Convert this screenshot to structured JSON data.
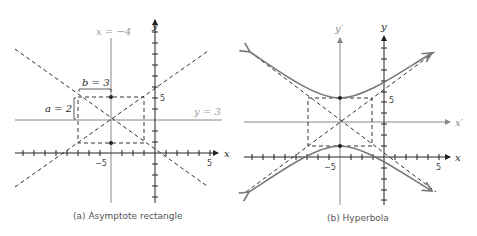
{
  "panels": [
    {
      "id": "a",
      "caption": "(a) Asymptote rectangle",
      "x_axis_label": "x",
      "y_axis_label": "y",
      "x_tick_neg5": "−5",
      "x_tick_5": "5",
      "y_tick_5": "5",
      "vertical_line_label": "x = −4",
      "horizontal_line_label": "y = 3",
      "b_label": "b = 3",
      "a_label": "a = 2"
    },
    {
      "id": "b",
      "caption": "(b) Hyperbola",
      "x_axis_label": "x",
      "y_axis_label": "y",
      "x_prime_label": "x′",
      "y_prime_label": "y′",
      "x_tick_neg5": "−5",
      "x_tick_5": "5",
      "y_tick_5": "5"
    }
  ],
  "colors": {
    "axis": "#222222",
    "guide": "#888888",
    "dash": "#333333",
    "curve": "#777777",
    "label_gray": "#999999"
  },
  "math": {
    "center": [
      -4,
      3
    ],
    "a": 2,
    "b": 3,
    "equation": "(y-3)^2/4 - (x+4)^2/9 = 1"
  }
}
